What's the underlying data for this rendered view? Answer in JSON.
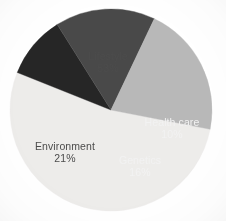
{
  "chart_data": {
    "type": "pie",
    "title": "",
    "subtitle": "",
    "xlabel": "",
    "ylabel": "",
    "legend_position": "none",
    "grid": false,
    "labels_inside_slices": true,
    "start_angle_deg": 101,
    "direction": "clockwise",
    "categories": [
      "Lifestyle",
      "Environment",
      "Genetics",
      "Health care"
    ],
    "values": [
      53,
      21,
      16,
      10
    ],
    "value_unit": "%",
    "total": 100,
    "slices": [
      {
        "name": "Lifestyle",
        "value": 53,
        "value_label": "53%",
        "color": "#edecea",
        "text_color": "#4c4c4c",
        "label_x": 108,
        "label_y": 62
      },
      {
        "name": "Health care",
        "value": 10,
        "value_label": "10%",
        "color": "#262626",
        "text_color": "#f2f2f2",
        "label_x": 172,
        "label_y": 128
      },
      {
        "name": "Genetics",
        "value": 16,
        "value_label": "16%",
        "color": "#4a4a4a",
        "text_color": "#f2f2f2",
        "label_x": 140,
        "label_y": 166
      },
      {
        "name": "Environment",
        "value": 21,
        "value_label": "21%",
        "color": "#b8b8b8",
        "text_color": "#4c4c4c",
        "label_x": 65,
        "label_y": 152
      }
    ],
    "geometry": {
      "center_x": 111,
      "center_y": 110,
      "radius": 101
    },
    "background_color": "#ffffff"
  }
}
